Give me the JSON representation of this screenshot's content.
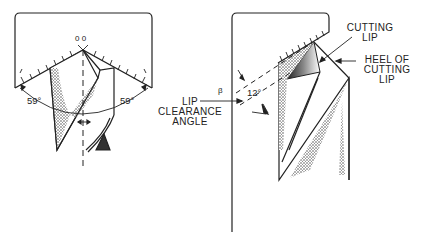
{
  "diagram": {
    "type": "technical-illustration",
    "left_view": {
      "angle_left": "59°",
      "angle_right": "59°",
      "gauge_mark": "0 0"
    },
    "right_view": {
      "clearance_angle": "12°",
      "small_mark": "β"
    },
    "labels": {
      "lip_clearance_angle_line1": "LIP",
      "lip_clearance_angle_line2": "CLEARANCE",
      "lip_clearance_angle_line3": "ANGLE",
      "cutting_lip_line1": "CUTTING",
      "cutting_lip_line2": "LIP",
      "heel_line1": "HEEL OF",
      "heel_line2": "CUTTING",
      "heel_line3": "LIP"
    },
    "colors": {
      "ink": "#222222",
      "background": "#ffffff"
    }
  }
}
